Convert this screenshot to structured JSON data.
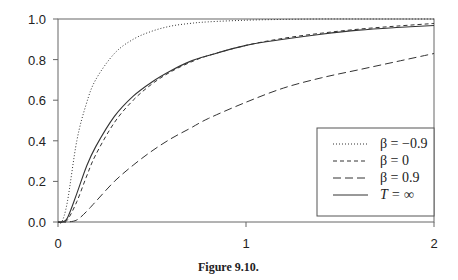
{
  "chart_data": {
    "type": "line",
    "title": "",
    "caption": "Figure 9.10.",
    "xlabel": "",
    "ylabel": "",
    "xlim": [
      0,
      2
    ],
    "ylim": [
      0,
      1.0
    ],
    "xticks": [
      "0",
      "1",
      "2"
    ],
    "yticks": [
      "0.0",
      "0.2",
      "0.4",
      "0.6",
      "0.8",
      "1.0"
    ],
    "grid": false,
    "legend_position": "lower right",
    "x": [
      0,
      0.02,
      0.05,
      0.1,
      0.15,
      0.2,
      0.3,
      0.4,
      0.5,
      0.6,
      0.7,
      0.8,
      1.0,
      1.2,
      1.4,
      1.6,
      1.8,
      2.0
    ],
    "series": [
      {
        "name": "β = −0.9",
        "style": "dotted",
        "values": [
          0,
          0.0,
          0.1,
          0.4,
          0.58,
          0.7,
          0.83,
          0.9,
          0.94,
          0.965,
          0.978,
          0.986,
          0.994,
          0.998,
          1.0,
          1.0,
          1.0,
          1.0
        ]
      },
      {
        "name": "β = 0",
        "style": "short-dash",
        "values": [
          0,
          0.0,
          0.01,
          0.1,
          0.22,
          0.33,
          0.49,
          0.6,
          0.68,
          0.74,
          0.785,
          0.82,
          0.87,
          0.905,
          0.93,
          0.95,
          0.965,
          0.978
        ]
      },
      {
        "name": "β = 0.9",
        "style": "long-dash",
        "values": [
          0,
          0.0,
          0.0,
          0.01,
          0.05,
          0.1,
          0.2,
          0.28,
          0.35,
          0.41,
          0.46,
          0.51,
          0.59,
          0.66,
          0.71,
          0.75,
          0.79,
          0.83
        ]
      },
      {
        "name": "T = ∞",
        "style": "solid",
        "values": [
          0,
          0.0,
          0.02,
          0.14,
          0.27,
          0.37,
          0.52,
          0.62,
          0.69,
          0.745,
          0.79,
          0.82,
          0.87,
          0.9,
          0.925,
          0.945,
          0.958,
          0.968
        ]
      }
    ]
  },
  "legend": {
    "items": [
      {
        "label": "β = −0.9"
      },
      {
        "label": "β = 0"
      },
      {
        "label": "β = 0.9"
      },
      {
        "label": "T = ∞"
      }
    ]
  },
  "figure": {
    "caption": "Figure 9.10."
  }
}
